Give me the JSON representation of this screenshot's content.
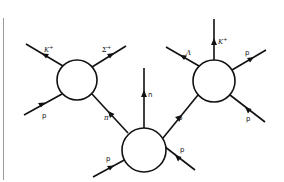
{
  "diagram": {
    "vertices": [
      {
        "id": "left",
        "label": ""
      },
      {
        "id": "middle",
        "label": ""
      },
      {
        "id": "right",
        "label": ""
      }
    ],
    "edges": [
      {
        "id": "left-K+",
        "label": "K⁺",
        "from": "left",
        "direction": "out"
      },
      {
        "id": "left-Sigma+",
        "label": "Σ⁺",
        "from": "left",
        "direction": "out"
      },
      {
        "id": "left-p-in",
        "label": "p",
        "to": "left",
        "direction": "in"
      },
      {
        "id": "pi+",
        "label": "π⁺",
        "from": "middle",
        "to": "left",
        "direction": "middle-to-left"
      },
      {
        "id": "middle-n",
        "label": "n",
        "from": "middle",
        "direction": "out"
      },
      {
        "id": "middle-p-in-left",
        "label": "p",
        "to": "middle",
        "direction": "in"
      },
      {
        "id": "middle-p-in-right",
        "label": "p",
        "to": "middle",
        "direction": "in"
      },
      {
        "id": "middle-to-right-p",
        "label": "p",
        "from": "middle",
        "to": "right",
        "direction": "middle-to-right"
      },
      {
        "id": "right-Lambda",
        "label": "Λ",
        "from": "right",
        "direction": "out"
      },
      {
        "id": "right-K+",
        "label": "K⁺",
        "from": "right",
        "direction": "out"
      },
      {
        "id": "right-p-out",
        "label": "p",
        "from": "right",
        "direction": "out"
      },
      {
        "id": "right-p-in",
        "label": "p",
        "to": "right",
        "direction": "in"
      }
    ]
  },
  "labels": {
    "left_K": "K",
    "left_K_sup": "+",
    "left_Sigma": "Σ",
    "left_Sigma_sup": "+",
    "left_p_in": "p",
    "pi": "π",
    "pi_sup": "+",
    "n": "n",
    "mid_p_in_left": "p",
    "mid_p_in_right": "p",
    "mid_to_right_p": "p",
    "right_Lambda": "Λ",
    "right_K": "K",
    "right_K_sup": "+",
    "right_p_out": "p",
    "right_p_in": "p"
  }
}
